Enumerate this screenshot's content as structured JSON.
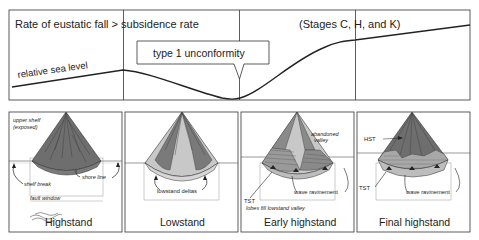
{
  "top_panel": {
    "header_left": "Rate of eustatic fall > subsidence rate",
    "header_right": "(Stages C, H, and K)",
    "curve_label": "relative sea level",
    "callout": "type 1 unconformity"
  },
  "panels": [
    {
      "caption": "Highstand",
      "labels": {
        "upper_shelf_1": "upper shelf",
        "upper_shelf_2": "(exposed)",
        "shelf_break": "shelf break",
        "shore_line": "shore line",
        "fault_window": "fault window"
      }
    },
    {
      "caption": "Lowstand",
      "labels": {
        "lowstand_deltas": "lowstand deltas"
      }
    },
    {
      "caption": "Early highstand",
      "labels": {
        "abandoned_1": "abandoned",
        "abandoned_2": "valley",
        "wave_ravinement": "wave ravinement",
        "tst": "TST",
        "lobes": "lobes fill lowstand valley"
      }
    },
    {
      "caption": "Final highstand",
      "labels": {
        "hst": "HST",
        "tst": "TST",
        "wave_ravinement": "wave ravinement"
      }
    }
  ],
  "colors": {
    "dark_fan": "#6e6e6e",
    "mid_fan": "#9a9a9a",
    "light_fan": "#c8c8c8",
    "line": "#222222",
    "frame": "#333333"
  }
}
